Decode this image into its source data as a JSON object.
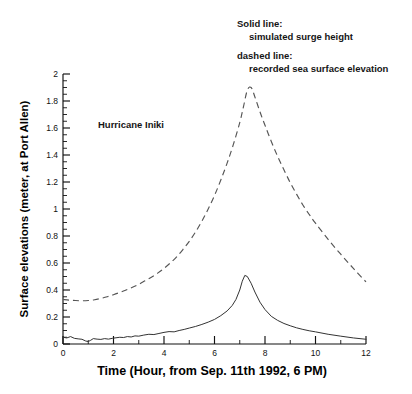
{
  "figure": {
    "annotation": "Hurricane Iniki",
    "legend": {
      "solid_title": "Solid line:",
      "solid_desc": "simulated surge height",
      "dashed_title": "dashed line:",
      "dashed_desc": "recorded sea surface elevation"
    }
  },
  "chart_data": {
    "type": "line",
    "title": "",
    "annotations": [
      "Hurricane Iniki"
    ],
    "xlabel": "Time (Hour, from Sep. 11th 1992, 6 PM)",
    "ylabel": "Surface elevations (meter, at Port Allen)",
    "xlim": [
      0,
      12
    ],
    "ylim": [
      0,
      2
    ],
    "xticks": [
      0,
      2,
      4,
      6,
      8,
      10,
      12
    ],
    "xticklabels": [
      "0",
      "2",
      "4",
      "6",
      "8",
      "10",
      "12"
    ],
    "xminorticks": [
      1,
      3,
      5,
      7,
      9,
      11
    ],
    "yticks": [
      0,
      0.2,
      0.4,
      0.6,
      0.8,
      1,
      1.2,
      1.4,
      1.6,
      1.8,
      2
    ],
    "yticklabels": [
      "0",
      "0.2",
      "0.4",
      "0.6",
      "0.8",
      "1",
      "1.2",
      "1.4",
      "1.6",
      "1.8",
      "2"
    ],
    "yminortick_step": 0.05,
    "grid": false,
    "legend_position": "top-right-text",
    "line_colors": {
      "solid": "#333333",
      "dashed": "#555555"
    },
    "series": [
      {
        "name": "simulated surge height",
        "style": "solid",
        "x": [
          0.0,
          0.15,
          0.3,
          0.45,
          0.6,
          0.75,
          0.9,
          1.0,
          1.1,
          1.2,
          1.35,
          1.5,
          1.65,
          1.8,
          1.95,
          2.1,
          2.25,
          2.4,
          2.55,
          2.7,
          2.85,
          3.0,
          3.2,
          3.4,
          3.6,
          3.8,
          4.0,
          4.2,
          4.4,
          4.6,
          4.8,
          5.0,
          5.25,
          5.5,
          5.75,
          6.0,
          6.25,
          6.5,
          6.7,
          6.85,
          7.0,
          7.1,
          7.2,
          7.3,
          7.45,
          7.6,
          7.8,
          8.0,
          8.25,
          8.5,
          8.75,
          9.0,
          9.25,
          9.5,
          9.75,
          10.0,
          10.5,
          11.0,
          11.5,
          12.0
        ],
        "y": [
          0.05,
          0.045,
          0.055,
          0.042,
          0.038,
          0.035,
          0.022,
          0.018,
          0.028,
          0.04,
          0.036,
          0.034,
          0.04,
          0.036,
          0.042,
          0.046,
          0.05,
          0.048,
          0.055,
          0.052,
          0.06,
          0.058,
          0.066,
          0.072,
          0.07,
          0.078,
          0.086,
          0.092,
          0.09,
          0.1,
          0.108,
          0.118,
          0.13,
          0.145,
          0.162,
          0.182,
          0.21,
          0.245,
          0.285,
          0.33,
          0.4,
          0.465,
          0.508,
          0.5,
          0.45,
          0.385,
          0.31,
          0.255,
          0.205,
          0.175,
          0.152,
          0.135,
          0.12,
          0.108,
          0.098,
          0.09,
          0.072,
          0.058,
          0.045,
          0.035
        ]
      },
      {
        "name": "recorded sea surface elevation",
        "style": "dashed",
        "x": [
          0.0,
          0.25,
          0.5,
          0.75,
          1.0,
          1.25,
          1.5,
          1.75,
          2.0,
          2.25,
          2.5,
          2.75,
          3.0,
          3.25,
          3.5,
          3.75,
          4.0,
          4.25,
          4.5,
          4.75,
          5.0,
          5.25,
          5.5,
          5.75,
          6.0,
          6.25,
          6.5,
          6.75,
          7.0,
          7.15,
          7.3,
          7.45,
          7.6,
          7.8,
          8.0,
          8.25,
          8.5,
          8.75,
          9.0,
          9.25,
          9.5,
          9.75,
          10.0,
          10.5,
          11.0,
          11.5,
          12.0
        ],
        "y": [
          0.33,
          0.325,
          0.322,
          0.32,
          0.322,
          0.328,
          0.338,
          0.35,
          0.365,
          0.382,
          0.4,
          0.42,
          0.442,
          0.468,
          0.495,
          0.525,
          0.56,
          0.6,
          0.645,
          0.7,
          0.76,
          0.83,
          0.91,
          1.0,
          1.1,
          1.215,
          1.34,
          1.48,
          1.64,
          1.76,
          1.88,
          1.9,
          1.83,
          1.72,
          1.62,
          1.5,
          1.39,
          1.29,
          1.195,
          1.11,
          1.03,
          0.96,
          0.895,
          0.775,
          0.665,
          0.56,
          0.46
        ]
      }
    ],
    "peaks": {
      "solid_peak": {
        "x": 7.2,
        "y": 0.51
      },
      "dashed_peak": {
        "x": 7.45,
        "y": 1.9
      }
    }
  }
}
